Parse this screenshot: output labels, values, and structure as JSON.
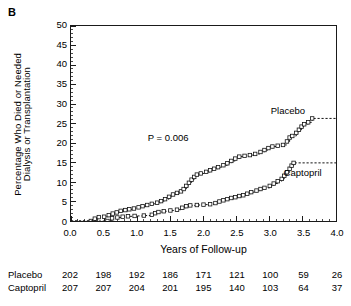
{
  "panel_label": "B",
  "chart_data": {
    "type": "line",
    "title": "",
    "subtitle": "",
    "xlabel": "Years of Follow-up",
    "ylabel": "Percentage Who Died or Needed Dialysis or Transplantation",
    "ylabel_lines": [
      "Percentage Who Died or Needed",
      "Dialysis or Transplantation"
    ],
    "xlim": [
      0.0,
      4.0
    ],
    "ylim": [
      0,
      50
    ],
    "xticks": [
      0.0,
      0.5,
      1.0,
      1.5,
      2.0,
      2.5,
      3.0,
      3.5,
      4.0
    ],
    "xtick_labels": [
      "0.0",
      "0.5",
      "1.0",
      "1.5",
      "2.0",
      "2.5",
      "3.0",
      "3.5",
      "4.0"
    ],
    "yticks": [
      0,
      5,
      10,
      15,
      20,
      25,
      30,
      35,
      40,
      45,
      50
    ],
    "ytick_labels": [
      "0",
      "5",
      "10",
      "15",
      "20",
      "25",
      "30",
      "35",
      "40",
      "45",
      "50"
    ],
    "grid": false,
    "legend_position": "inline-annotation",
    "annotations": [
      {
        "name": "p-value",
        "text": "P = 0.006",
        "x": 1.15,
        "y": 21.5
      }
    ],
    "series": [
      {
        "name": "Placebo",
        "label_x": 3.25,
        "label_y": 28.5,
        "marker": "open-square",
        "linestyle": "dashed-step",
        "points": [
          [
            0.0,
            0.0
          ],
          [
            0.3,
            0.0
          ],
          [
            0.36,
            0.6
          ],
          [
            0.42,
            1.0
          ],
          [
            0.5,
            1.1
          ],
          [
            0.57,
            1.5
          ],
          [
            0.63,
            1.9
          ],
          [
            0.69,
            2.2
          ],
          [
            0.75,
            2.6
          ],
          [
            0.82,
            2.8
          ],
          [
            0.88,
            3.0
          ],
          [
            0.95,
            3.2
          ],
          [
            1.02,
            3.5
          ],
          [
            1.08,
            3.8
          ],
          [
            1.15,
            4.1
          ],
          [
            1.22,
            4.4
          ],
          [
            1.3,
            4.7
          ],
          [
            1.36,
            5.1
          ],
          [
            1.42,
            5.6
          ],
          [
            1.48,
            6.2
          ],
          [
            1.54,
            6.8
          ],
          [
            1.6,
            7.2
          ],
          [
            1.66,
            7.6
          ],
          [
            1.7,
            8.2
          ],
          [
            1.74,
            9.0
          ],
          [
            1.78,
            9.8
          ],
          [
            1.82,
            10.6
          ],
          [
            1.86,
            11.3
          ],
          [
            1.9,
            11.9
          ],
          [
            1.96,
            12.2
          ],
          [
            2.04,
            12.6
          ],
          [
            2.1,
            13.0
          ],
          [
            2.16,
            13.4
          ],
          [
            2.22,
            13.8
          ],
          [
            2.3,
            14.3
          ],
          [
            2.36,
            14.8
          ],
          [
            2.42,
            15.4
          ],
          [
            2.48,
            16.0
          ],
          [
            2.54,
            16.5
          ],
          [
            2.62,
            16.7
          ],
          [
            2.7,
            16.9
          ],
          [
            2.78,
            17.2
          ],
          [
            2.86,
            17.7
          ],
          [
            2.92,
            18.2
          ],
          [
            2.98,
            18.7
          ],
          [
            3.04,
            19.1
          ],
          [
            3.12,
            19.3
          ],
          [
            3.2,
            19.5
          ],
          [
            3.26,
            20.4
          ],
          [
            3.3,
            21.4
          ],
          [
            3.34,
            21.8
          ],
          [
            3.4,
            22.6
          ],
          [
            3.44,
            23.4
          ],
          [
            3.48,
            24.2
          ],
          [
            3.52,
            24.8
          ],
          [
            3.58,
            25.3
          ],
          [
            3.64,
            26.3
          ],
          [
            4.0,
            26.3
          ]
        ]
      },
      {
        "name": "Captopril",
        "label_x": 3.47,
        "label_y": 12.7,
        "marker": "open-square",
        "linestyle": "dashed-step",
        "points": [
          [
            0.0,
            0.0
          ],
          [
            0.55,
            0.0
          ],
          [
            0.62,
            0.7
          ],
          [
            0.7,
            0.9
          ],
          [
            0.78,
            1.1
          ],
          [
            0.86,
            1.2
          ],
          [
            0.96,
            1.3
          ],
          [
            1.1,
            1.4
          ],
          [
            1.22,
            1.6
          ],
          [
            1.27,
            2.0
          ],
          [
            1.32,
            2.3
          ],
          [
            1.4,
            2.5
          ],
          [
            1.5,
            2.7
          ],
          [
            1.6,
            2.9
          ],
          [
            1.68,
            3.4
          ],
          [
            1.74,
            3.8
          ],
          [
            1.8,
            4.0
          ],
          [
            1.9,
            4.1
          ],
          [
            2.0,
            4.2
          ],
          [
            2.1,
            4.3
          ],
          [
            2.18,
            4.6
          ],
          [
            2.24,
            5.0
          ],
          [
            2.3,
            5.3
          ],
          [
            2.36,
            5.6
          ],
          [
            2.42,
            5.9
          ],
          [
            2.48,
            6.1
          ],
          [
            2.54,
            6.4
          ],
          [
            2.6,
            6.6
          ],
          [
            2.66,
            7.0
          ],
          [
            2.72,
            7.4
          ],
          [
            2.8,
            7.8
          ],
          [
            2.86,
            8.2
          ],
          [
            2.92,
            8.5
          ],
          [
            3.0,
            9.0
          ],
          [
            3.06,
            9.6
          ],
          [
            3.12,
            10.2
          ],
          [
            3.18,
            10.8
          ],
          [
            3.22,
            11.6
          ],
          [
            3.26,
            12.5
          ],
          [
            3.3,
            13.4
          ],
          [
            3.33,
            14.2
          ],
          [
            3.36,
            14.9
          ],
          [
            4.0,
            14.9
          ]
        ]
      }
    ]
  },
  "at_risk": {
    "columns": [
      "0.0",
      "0.5",
      "1.0",
      "1.5",
      "2.0",
      "2.5",
      "3.0",
      "3.5",
      "4.0"
    ],
    "rows": [
      {
        "label": "Placebo",
        "values": [
          "202",
          "198",
          "192",
          "186",
          "171",
          "121",
          "100",
          "59",
          "26"
        ]
      },
      {
        "label": "Captopril",
        "values": [
          "207",
          "207",
          "204",
          "201",
          "195",
          "140",
          "103",
          "64",
          "37"
        ]
      }
    ]
  },
  "colors": {
    "ink": "#1a1a1a",
    "background": "#ffffff",
    "curve": "#111111"
  }
}
